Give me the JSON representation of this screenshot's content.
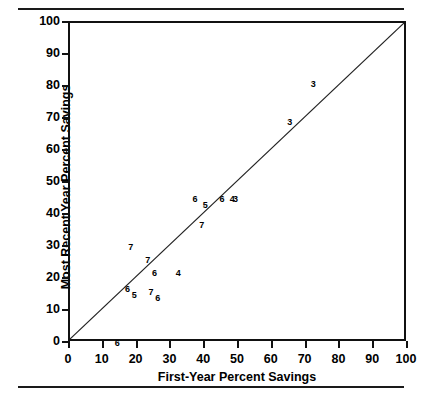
{
  "chart_data": {
    "type": "scatter",
    "title": "",
    "xlabel": "First-Year Percent Savings",
    "ylabel": "Most Recent Year Percent Savings",
    "xlim": [
      0,
      100
    ],
    "ylim": [
      0,
      100
    ],
    "xticks": [
      0,
      10,
      20,
      30,
      40,
      50,
      60,
      70,
      80,
      90,
      100
    ],
    "yticks": [
      0,
      10,
      20,
      30,
      40,
      50,
      60,
      70,
      80,
      90,
      100
    ],
    "grid": false,
    "legend": null,
    "marker_style": "numeric-digit-labels",
    "reference_line": {
      "description": "45-degree identity line",
      "from": [
        0,
        0
      ],
      "to": [
        100,
        100
      ]
    },
    "points": [
      {
        "label": "6",
        "x": 14,
        "y": 0
      },
      {
        "label": "6",
        "x": 17,
        "y": 17
      },
      {
        "label": "5",
        "x": 19,
        "y": 15
      },
      {
        "label": "7",
        "x": 24,
        "y": 16
      },
      {
        "label": "6",
        "x": 26,
        "y": 14
      },
      {
        "label": "7",
        "x": 18,
        "y": 30
      },
      {
        "label": "7",
        "x": 23,
        "y": 26
      },
      {
        "label": "6",
        "x": 25,
        "y": 22
      },
      {
        "label": "4",
        "x": 32,
        "y": 22
      },
      {
        "label": "7",
        "x": 39,
        "y": 37
      },
      {
        "label": "6",
        "x": 37,
        "y": 45
      },
      {
        "label": "5",
        "x": 40,
        "y": 43
      },
      {
        "label": "6",
        "x": 45,
        "y": 45
      },
      {
        "label": "4",
        "x": 48,
        "y": 45
      },
      {
        "label": "3",
        "x": 49,
        "y": 45
      },
      {
        "label": "3",
        "x": 65,
        "y": 69
      },
      {
        "label": "3",
        "x": 72,
        "y": 81
      }
    ]
  },
  "axes": {
    "x_title": "First-Year Percent Savings",
    "y_title": "Most Recent Year Percent Savings"
  }
}
